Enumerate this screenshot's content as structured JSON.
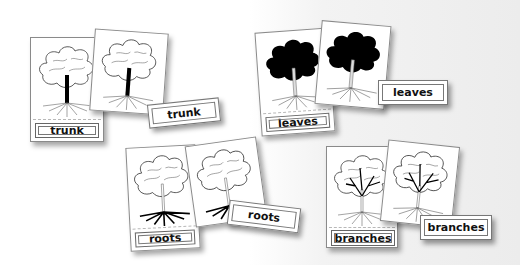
{
  "sets": [
    {
      "id": "trunk",
      "control_label": "trunk",
      "loose_label": "trunk",
      "highlight": "trunk"
    },
    {
      "id": "leaves",
      "control_label": "leaves",
      "loose_label": "leaves",
      "highlight": "leaves"
    },
    {
      "id": "roots",
      "control_label": "roots",
      "loose_label": "roots",
      "highlight": "roots"
    },
    {
      "id": "branches",
      "control_label": "branches",
      "loose_label": "branches",
      "highlight": "branches"
    }
  ],
  "colors": {
    "card_border": "#8a8a8a",
    "ink": "#111111",
    "background_right": "#ececec"
  }
}
